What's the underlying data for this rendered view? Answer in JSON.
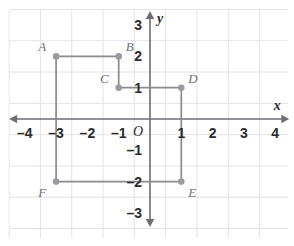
{
  "chart_data": {
    "type": "scatter",
    "title": "",
    "xlabel": "x",
    "ylabel": "y",
    "grid": true,
    "legend": "none",
    "xlim": [
      -4.6,
      4.6
    ],
    "ylim": [
      -3.6,
      3.6
    ],
    "xticks": [
      -4,
      -3,
      -2,
      -1,
      1,
      2,
      3,
      4
    ],
    "yticks": [
      3,
      2,
      1,
      -1,
      -2,
      -3
    ],
    "xtick_labels": [
      "–4",
      "–3",
      "–2",
      "–1",
      "1",
      "2",
      "3",
      "4"
    ],
    "ytick_labels": [
      "3",
      "2",
      "1",
      "–1",
      "–2",
      "–3"
    ],
    "origin_label": "O",
    "points": [
      {
        "label": "A",
        "x": -3,
        "y": 2,
        "label_pos": "upper-left"
      },
      {
        "label": "B",
        "x": -1,
        "y": 2,
        "label_pos": "upper-right"
      },
      {
        "label": "C",
        "x": -1,
        "y": 1,
        "label_pos": "upper-left"
      },
      {
        "label": "D",
        "x": 1,
        "y": 1,
        "label_pos": "upper-right"
      },
      {
        "label": "E",
        "x": 1,
        "y": -2,
        "label_pos": "lower-right"
      },
      {
        "label": "F",
        "x": -3,
        "y": -2,
        "label_pos": "lower-left"
      }
    ],
    "polygon": [
      {
        "label": "A",
        "x": -3,
        "y": 2
      },
      {
        "label": "B",
        "x": -1,
        "y": 2
      },
      {
        "label": "C",
        "x": -1,
        "y": 1
      },
      {
        "label": "D",
        "x": 1,
        "y": 1
      },
      {
        "label": "E",
        "x": 1,
        "y": -2
      },
      {
        "label": "F",
        "x": -3,
        "y": -2
      }
    ],
    "closed": true
  },
  "colors": {
    "grid": "#e3e3e6",
    "axis": "#6d6d72",
    "shape_stroke": "#8a8a90",
    "point_fill": "#9a9aa0",
    "tick_text": "#2b2b2b",
    "point_label": "#6f6f74",
    "background": "#ffffff"
  },
  "geometry": {
    "origin_px": {
      "x": 150,
      "y": 119
    },
    "unit_px": 31.3,
    "grid_bounds": {
      "left": 10,
      "top": 10,
      "right": 288,
      "bottom": 238
    },
    "x_axis_span": {
      "from": -4.5,
      "to": 4.45
    },
    "y_axis_span": {
      "from": -3.45,
      "to": 3.45
    }
  }
}
